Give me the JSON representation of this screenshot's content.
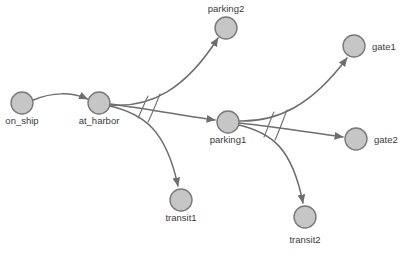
{
  "diagram": {
    "background_color": "#ffffff",
    "node_fill": "#c6c6c6",
    "node_stroke": "#7a7a7a",
    "edge_color": "#6e6e6e",
    "label_color": "#3a3a3a",
    "nodes": [
      {
        "id": "on_ship",
        "label": "on_ship",
        "cx": 22,
        "cy": 103,
        "r": 11,
        "label_x": 22,
        "label_y": 124,
        "label_anchor": "middle"
      },
      {
        "id": "at_harbor",
        "label": "at_harbor",
        "cx": 99,
        "cy": 103,
        "r": 11,
        "label_x": 99,
        "label_y": 124,
        "label_anchor": "middle"
      },
      {
        "id": "parking2",
        "label": "parking2",
        "cx": 226,
        "cy": 28,
        "r": 11,
        "label_x": 226,
        "label_y": 12,
        "label_anchor": "middle"
      },
      {
        "id": "parking1",
        "label": "parking1",
        "cx": 228,
        "cy": 122,
        "r": 11,
        "label_x": 228,
        "label_y": 143,
        "label_anchor": "middle"
      },
      {
        "id": "transit1",
        "label": "transit1",
        "cx": 181,
        "cy": 200,
        "r": 11,
        "label_x": 181,
        "label_y": 221,
        "label_anchor": "middle"
      },
      {
        "id": "transit2",
        "label": "transit2",
        "cx": 305,
        "cy": 217,
        "r": 11,
        "label_x": 305,
        "label_y": 243,
        "label_anchor": "middle"
      },
      {
        "id": "gate1",
        "label": "gate1",
        "cx": 354,
        "cy": 46,
        "r": 11,
        "label_x": 372,
        "label_y": 50,
        "label_anchor": "start"
      },
      {
        "id": "gate2",
        "label": "gate2",
        "cx": 356,
        "cy": 139,
        "r": 11,
        "label_x": 374,
        "label_y": 143,
        "label_anchor": "start"
      }
    ],
    "edges": [
      {
        "id": "edge-on_ship-at_harbor",
        "from": "on_ship",
        "to": "at_harbor",
        "path": "M 33.5,100 C 52,92 72,92 87.5,99"
      },
      {
        "id": "edge-at_harbor-parking2",
        "from": "at_harbor",
        "to": "parking2",
        "path": "M 110,105 C 150,108 185,90 218,38"
      },
      {
        "id": "edge-at_harbor-parking1",
        "from": "at_harbor",
        "to": "parking1",
        "path": "M 110,104 C 150,109 185,116 215,120"
      },
      {
        "id": "edge-at_harbor-transit1",
        "from": "at_harbor",
        "to": "transit1",
        "path": "M 110,106 C 144,114 166,130 178,186"
      },
      {
        "id": "edge-parking1-gate1",
        "from": "parking1",
        "to": "gate1",
        "path": "M 239,121 C 278,122 312,105 347,58"
      },
      {
        "id": "edge-parking1-gate2",
        "from": "parking1",
        "to": "gate2",
        "path": "M 239,123 C 278,127 312,133 343,137"
      },
      {
        "id": "edge-parking1-transit2",
        "from": "parking1",
        "to": "transit2",
        "path": "M 239,125 C 272,133 292,148 303,203"
      }
    ],
    "connector_arcs": [
      {
        "id": "arc-at_harbor-a",
        "path": "M 148,96 C 144,104 142,110 138,118"
      },
      {
        "id": "arc-at_harbor-b",
        "path": "M 160,94 C 156,104 153,112 148,122"
      },
      {
        "id": "arc-parking1-a",
        "path": "M 274,112 C 270,120 268,128 264,137"
      },
      {
        "id": "arc-parking1-b",
        "path": "M 287,110 C 283,120 280,129 275,140"
      }
    ]
  }
}
